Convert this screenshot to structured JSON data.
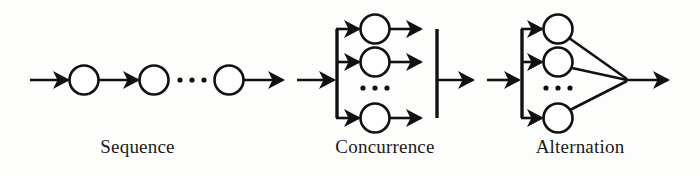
{
  "figure": {
    "background_color": "#fdfdfc",
    "stroke_color": "#111111",
    "node_fill_color": "#ffffff"
  },
  "panels": [
    {
      "id": "sequence",
      "label": "Sequence",
      "pattern": "linear chain of nodes connected by arrows with an ellipsis gap",
      "node_count_shown": 3,
      "ellipsis": "...",
      "arrow_count": 3
    },
    {
      "id": "concurrence",
      "label": "Concurrence",
      "pattern": "fork bar splits one input into parallel branches that rejoin at a join bar",
      "node_count_shown": 3,
      "ellipsis": "...",
      "has_fork_bar": true,
      "has_join_bar": true
    },
    {
      "id": "alternation",
      "label": "Alternation",
      "pattern": "fork bar splits one input into alternative branches that converge to a single point",
      "node_count_shown": 3,
      "ellipsis": "...",
      "has_fork_bar": true,
      "has_join_bar": false
    }
  ],
  "captions": {
    "sequence": "Sequence",
    "concurrence": "Concurrence",
    "alternation": "Alternation"
  },
  "icons": {
    "node": "circle-node-icon",
    "arrow": "arrow-right-icon",
    "ellipsis": "ellipsis-icon",
    "fork_bar": "fork-bar-icon",
    "join_bar": "join-bar-icon"
  }
}
